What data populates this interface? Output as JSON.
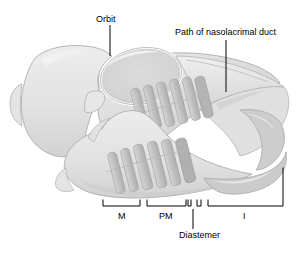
{
  "figure": {
    "background_color": "#ffffff",
    "width": 296,
    "height": 254
  },
  "labels": {
    "orbit": "Orbit",
    "nasolacrimal_duct": "Path of nasolacrimal duct",
    "molars": "M",
    "premolars": "PM",
    "incisors": "I",
    "diastema": "Diastemer"
  },
  "colors": {
    "line": "#000000",
    "bone_light": "#e6e6e6",
    "bone_mid": "#dadada",
    "bone_shadow": "#c9c9c9",
    "tooth": "#c4c4c4",
    "tooth_dark": "#b2b2b2",
    "outline": "#9a9a9a",
    "text": "#000000"
  },
  "leaders": {
    "orbit": {
      "x": 110,
      "y1": 25,
      "y2": 56
    },
    "nasolacrimal_duct": {
      "x": 226,
      "y1": 40,
      "y2": 92
    },
    "diastema": {
      "x": 193,
      "y1": 209,
      "y2": 229
    }
  },
  "brackets": [
    {
      "name": "molars",
      "x1": 103,
      "x2": 140,
      "y": 206,
      "tick": 6,
      "label": "M"
    },
    {
      "name": "premolars",
      "x1": 147,
      "x2": 186,
      "y": 206,
      "tick": 6,
      "label": "PM"
    },
    {
      "name": "diastema-left",
      "x1": 186,
      "x2": 190,
      "y": 206,
      "tick": 6,
      "label": ""
    },
    {
      "name": "diastema-right",
      "x1": 196,
      "x2": 202,
      "y": 206,
      "tick": 6,
      "label": ""
    },
    {
      "name": "incisors",
      "x1": 208,
      "x2": 283,
      "y": 206,
      "tick": 6,
      "label": "I"
    }
  ],
  "teeth": {
    "upper_row_count": 6,
    "lower_row_count": 6
  }
}
